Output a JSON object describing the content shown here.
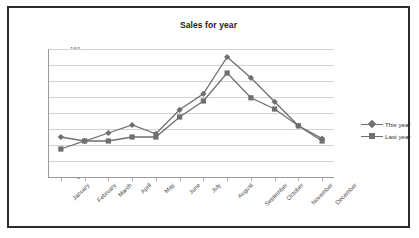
{
  "chart_data": {
    "type": "line",
    "title": "Sales for year",
    "xlabel": "",
    "ylabel": "",
    "ylim": [
      0,
      160
    ],
    "ytick_step": 20,
    "yticks": [
      160,
      140,
      120,
      100,
      80,
      60,
      40,
      20,
      0
    ],
    "grid": true,
    "legend_position": "right",
    "categories": [
      "January",
      "February",
      "March",
      "April",
      "May",
      "June",
      "July",
      "August",
      "September",
      "October",
      "November",
      "December"
    ],
    "series": [
      {
        "name": "This year",
        "marker": "diamond",
        "color": "#6f6f6f",
        "values": [
          50,
          45,
          55,
          65,
          54,
          84,
          104,
          150,
          124,
          94,
          64,
          48
        ]
      },
      {
        "name": "Last year",
        "marker": "square",
        "color": "#6f6f6f",
        "values": [
          35,
          45,
          45,
          50,
          50,
          75,
          95,
          130,
          99,
          85,
          64,
          45
        ]
      }
    ]
  },
  "colors": {
    "frame_border": "#2b2b2b",
    "gridline": "#d2d2d2",
    "axis": "#9a9a9a",
    "title_text": "#1b1b1b",
    "tick_text": "#5d5d5d",
    "series": "#6f6f6f"
  }
}
